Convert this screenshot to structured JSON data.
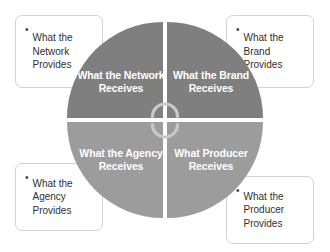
{
  "diagram": {
    "type": "cycle-quadrant-wheel",
    "center_icon": "cycle-arrows-icon",
    "colors": {
      "top_quadrant_fill": "#7f7f7f",
      "bottom_quadrant_fill": "#9c9c9c",
      "quadrant_text": "#ffffff",
      "callout_border": "#d3d3d3",
      "callout_background": "#ffffff",
      "callout_text": "#2f2f2f",
      "background": "#ffffff"
    },
    "quadrants": [
      {
        "id": "network-receives",
        "position": "top-left",
        "label": "What the\nNetwork\nReceives"
      },
      {
        "id": "brand-receives",
        "position": "top-right",
        "label": "What the\nBrand\nReceives"
      },
      {
        "id": "agency-receives",
        "position": "bottom-left",
        "label": "What the\nAgency\nReceives"
      },
      {
        "id": "producer-receives",
        "position": "bottom-right",
        "label": "What\nProducer\nReceives"
      }
    ],
    "callouts": [
      {
        "id": "network-provides",
        "position": "top-left",
        "bullet": "•",
        "text": "What the\nNetwork\nProvides"
      },
      {
        "id": "brand-provides",
        "position": "top-right",
        "bullet": "•",
        "text": "What the\nBrand\nProvides"
      },
      {
        "id": "agency-provides",
        "position": "bottom-left",
        "bullet": "•",
        "text": "What the\nAgency\nProvides"
      },
      {
        "id": "producer-provides",
        "position": "bottom-right",
        "bullet": "•",
        "text": "What the\nProducer\nProvides"
      }
    ]
  }
}
